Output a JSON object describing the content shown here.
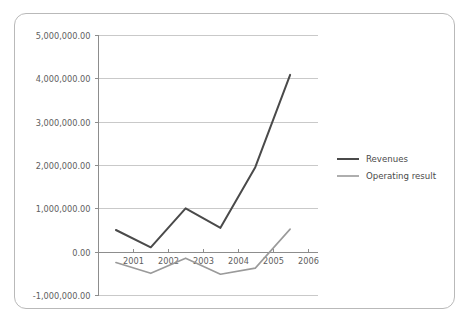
{
  "card": {
    "border_color": "#b9b9b9",
    "background": "#ffffff"
  },
  "chart_data": {
    "type": "line",
    "title": "",
    "subtitle": "",
    "xlabel": "",
    "ylabel": "",
    "x": [
      2000.5,
      2001.5,
      2002.5,
      2003.5,
      2004.5,
      2005.5
    ],
    "x_tick_labels": [
      "2001",
      "2002",
      "2003",
      "2004",
      "2005",
      "2006"
    ],
    "x_tick_values": [
      2001,
      2002,
      2003,
      2004,
      2005,
      2006
    ],
    "xlim": [
      2000.0,
      2006.3
    ],
    "y_tick_labels": [
      "5,000,000.00",
      "4,000,000.00",
      "3,000,000.00",
      "2,000,000.00",
      "1,000,000.00",
      "0.00",
      "-1,000,000.00"
    ],
    "y_tick_values": [
      5000000,
      4000000,
      3000000,
      2000000,
      1000000,
      0,
      -1000000
    ],
    "ylim": [
      -1000000,
      5000000
    ],
    "grid": true,
    "grid_axis": "y",
    "legend_position": "right",
    "series": [
      {
        "name": "Revenues",
        "color": "#4a4a4a",
        "width": 2.0,
        "values": [
          500000,
          100000,
          1000000,
          550000,
          1950000,
          4080000
        ]
      },
      {
        "name": "Operating result",
        "color": "#9a9a9a",
        "width": 1.6,
        "values": [
          -250000,
          -500000,
          -150000,
          -520000,
          -380000,
          520000
        ]
      }
    ]
  }
}
